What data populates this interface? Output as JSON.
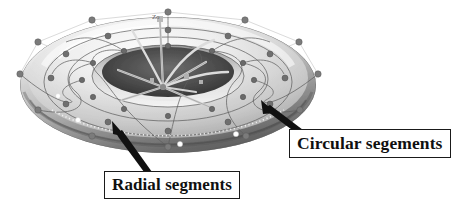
{
  "figure": {
    "kind": "torus-control-mesh-diagram",
    "background_color": "#ffffff",
    "width": 472,
    "height": 212,
    "axis_label": "Zo"
  },
  "annotations": [
    {
      "id": "circular",
      "label": "Circular segements",
      "box_color": "#ffffff",
      "border_color": "#1a1a1a",
      "arrow_color": "#111111",
      "points_to": "torus-outer-surface-right"
    },
    {
      "id": "radial",
      "label": "Radial segments",
      "box_color": "#ffffff",
      "border_color": "#1a1a1a",
      "arrow_color": "#111111",
      "points_to": "torus-lower-left-surface"
    }
  ],
  "palette": {
    "surface_light": "#f2f2f2",
    "surface_mid": "#c9c9c9",
    "surface_dark": "#8e8e8e",
    "surface_shadow": "#4a4a4a",
    "inner_hole": "#3a3a3a",
    "mesh_line": "#b8b8b8",
    "iso_line": "#6d6d6d",
    "control_point": "#777777",
    "highlight_point": "#fdfdfd",
    "axis_line": "#cfcfcf",
    "text": "#101010"
  },
  "mesh": {
    "control_points_outer": 12,
    "control_points_mid": 12,
    "control_points_inner": 12,
    "radial_segment_count": 12,
    "circular_segment_count": 6
  }
}
